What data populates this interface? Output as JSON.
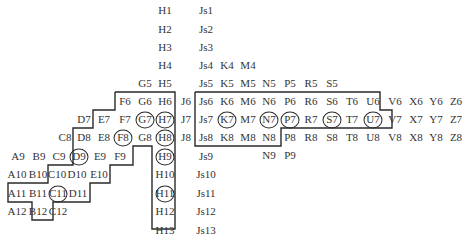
{
  "diagram": {
    "colors": {
      "text": "#333333",
      "line": "#2a2a2a",
      "background": "#ffffff"
    },
    "cells": [
      {
        "label": "H1",
        "x": 165,
        "y": 10
      },
      {
        "label": "Js1",
        "x": 206,
        "y": 10
      },
      {
        "label": "H2",
        "x": 165,
        "y": 29
      },
      {
        "label": "Js2",
        "x": 206,
        "y": 29
      },
      {
        "label": "H3",
        "x": 165,
        "y": 47
      },
      {
        "label": "Js3",
        "x": 206,
        "y": 47
      },
      {
        "label": "H4",
        "x": 165,
        "y": 65
      },
      {
        "label": "Js4",
        "x": 206,
        "y": 65
      },
      {
        "label": "K4",
        "x": 227,
        "y": 65
      },
      {
        "label": "M4",
        "x": 248,
        "y": 65
      },
      {
        "label": "G5",
        "x": 145,
        "y": 83
      },
      {
        "label": "H5",
        "x": 165,
        "y": 83
      },
      {
        "label": "Js5",
        "x": 206,
        "y": 83
      },
      {
        "label": "K5",
        "x": 227,
        "y": 83
      },
      {
        "label": "M5",
        "x": 248,
        "y": 83
      },
      {
        "label": "N5",
        "x": 269,
        "y": 83
      },
      {
        "label": "P5",
        "x": 290,
        "y": 83
      },
      {
        "label": "R5",
        "x": 311,
        "y": 83
      },
      {
        "label": "S5",
        "x": 332,
        "y": 83
      },
      {
        "label": "F6",
        "x": 125,
        "y": 101
      },
      {
        "label": "G6",
        "x": 145,
        "y": 101
      },
      {
        "label": "H6",
        "x": 165,
        "y": 101
      },
      {
        "label": "J6",
        "x": 186,
        "y": 101
      },
      {
        "label": "Js6",
        "x": 206,
        "y": 101
      },
      {
        "label": "K6",
        "x": 227,
        "y": 101
      },
      {
        "label": "M6",
        "x": 248,
        "y": 101
      },
      {
        "label": "N6",
        "x": 269,
        "y": 101
      },
      {
        "label": "P6",
        "x": 290,
        "y": 101
      },
      {
        "label": "R6",
        "x": 311,
        "y": 101
      },
      {
        "label": "S6",
        "x": 332,
        "y": 101
      },
      {
        "label": "T6",
        "x": 352,
        "y": 101
      },
      {
        "label": "U6",
        "x": 373,
        "y": 101
      },
      {
        "label": "V6",
        "x": 395,
        "y": 101
      },
      {
        "label": "X6",
        "x": 416,
        "y": 101
      },
      {
        "label": "Y6",
        "x": 436,
        "y": 101
      },
      {
        "label": "Z6",
        "x": 456,
        "y": 101
      },
      {
        "label": "D7",
        "x": 84,
        "y": 119
      },
      {
        "label": "E7",
        "x": 104,
        "y": 119
      },
      {
        "label": "F7",
        "x": 125,
        "y": 119
      },
      {
        "label": "G7",
        "x": 145,
        "y": 119,
        "circled": true
      },
      {
        "label": "H7",
        "x": 165,
        "y": 119,
        "circled": true
      },
      {
        "label": "J7",
        "x": 186,
        "y": 119
      },
      {
        "label": "Js7",
        "x": 206,
        "y": 119
      },
      {
        "label": "K7",
        "x": 227,
        "y": 119,
        "circled": true
      },
      {
        "label": "M7",
        "x": 248,
        "y": 119
      },
      {
        "label": "N7",
        "x": 269,
        "y": 119,
        "circled": true
      },
      {
        "label": "P7",
        "x": 290,
        "y": 119,
        "circled": true
      },
      {
        "label": "R7",
        "x": 311,
        "y": 119
      },
      {
        "label": "S7",
        "x": 332,
        "y": 119,
        "circled": true
      },
      {
        "label": "T7",
        "x": 352,
        "y": 119
      },
      {
        "label": "U7",
        "x": 373,
        "y": 119,
        "circled": true
      },
      {
        "label": "V7",
        "x": 395,
        "y": 119
      },
      {
        "label": "X7",
        "x": 416,
        "y": 119
      },
      {
        "label": "Y7",
        "x": 436,
        "y": 119
      },
      {
        "label": "Z7",
        "x": 456,
        "y": 119
      },
      {
        "label": "C8",
        "x": 65,
        "y": 137
      },
      {
        "label": "D8",
        "x": 84,
        "y": 137
      },
      {
        "label": "E8",
        "x": 104,
        "y": 137
      },
      {
        "label": "F8",
        "x": 123,
        "y": 137,
        "circled": true
      },
      {
        "label": "G8",
        "x": 145,
        "y": 137
      },
      {
        "label": "H8",
        "x": 165,
        "y": 137,
        "circled": true
      },
      {
        "label": "J8",
        "x": 186,
        "y": 137
      },
      {
        "label": "Js8",
        "x": 206,
        "y": 137
      },
      {
        "label": "K8",
        "x": 227,
        "y": 137
      },
      {
        "label": "M8",
        "x": 248,
        "y": 137
      },
      {
        "label": "N8",
        "x": 269,
        "y": 137
      },
      {
        "label": "P8",
        "x": 290,
        "y": 137
      },
      {
        "label": "R8",
        "x": 311,
        "y": 137
      },
      {
        "label": "S8",
        "x": 332,
        "y": 137
      },
      {
        "label": "T8",
        "x": 352,
        "y": 137
      },
      {
        "label": "U8",
        "x": 373,
        "y": 137
      },
      {
        "label": "V8",
        "x": 395,
        "y": 137
      },
      {
        "label": "X8",
        "x": 416,
        "y": 137
      },
      {
        "label": "Y8",
        "x": 436,
        "y": 137
      },
      {
        "label": "Z8",
        "x": 456,
        "y": 137
      },
      {
        "label": "A9",
        "x": 18,
        "y": 156
      },
      {
        "label": "B9",
        "x": 39,
        "y": 156
      },
      {
        "label": "C9",
        "x": 59,
        "y": 156
      },
      {
        "label": "D9",
        "x": 79,
        "y": 156,
        "circled": true
      },
      {
        "label": "E9",
        "x": 100,
        "y": 156
      },
      {
        "label": "F9",
        "x": 120,
        "y": 156
      },
      {
        "label": "H9",
        "x": 165,
        "y": 156,
        "circled": true
      },
      {
        "label": "Js9",
        "x": 206,
        "y": 156
      },
      {
        "label": "N9",
        "x": 269,
        "y": 155
      },
      {
        "label": "P9",
        "x": 290,
        "y": 155
      },
      {
        "label": "A10",
        "x": 17,
        "y": 174
      },
      {
        "label": "B10",
        "x": 38,
        "y": 174
      },
      {
        "label": "C10",
        "x": 57,
        "y": 174
      },
      {
        "label": "D10",
        "x": 77,
        "y": 174
      },
      {
        "label": "E10",
        "x": 99,
        "y": 174
      },
      {
        "label": "H10",
        "x": 165,
        "y": 174
      },
      {
        "label": "Js10",
        "x": 206,
        "y": 174
      },
      {
        "label": "A11",
        "x": 17,
        "y": 193
      },
      {
        "label": "B11",
        "x": 38,
        "y": 193
      },
      {
        "label": "C11",
        "x": 58,
        "y": 193,
        "circled": true
      },
      {
        "label": "D11",
        "x": 78,
        "y": 193
      },
      {
        "label": "H11",
        "x": 165,
        "y": 193,
        "circled": true
      },
      {
        "label": "Js11",
        "x": 206,
        "y": 193
      },
      {
        "label": "A12",
        "x": 17,
        "y": 211
      },
      {
        "label": "B12",
        "x": 38,
        "y": 211
      },
      {
        "label": "C12",
        "x": 58,
        "y": 211
      },
      {
        "label": "H12",
        "x": 165,
        "y": 211
      },
      {
        "label": "Js12",
        "x": 206,
        "y": 211
      },
      {
        "label": "H13",
        "x": 165,
        "y": 230
      },
      {
        "label": "Js13",
        "x": 206,
        "y": 230
      }
    ],
    "outlines": [
      {
        "name": "left-staircase-region",
        "points": "115,92 175,92 175,229 152,229 152,146 133,146 133,165 110,165 110,183 90,183 90,202 53,202 53,220 32,220 32,202 8,202 8,183 48,183 48,165 73,165 73,128 93,128 93,110 115,110 115,92"
      },
      {
        "name": "right-block-region",
        "points": "195,92 380,92 380,110 392,110 392,128 281,128 281,146 195,146 195,92"
      }
    ]
  }
}
